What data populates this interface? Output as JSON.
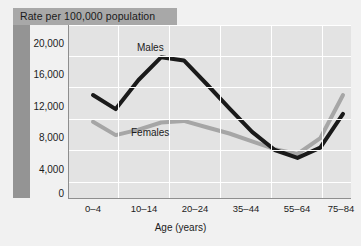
{
  "title": "Rate per 100,000 population",
  "axis": {
    "x_title": "Age (years)",
    "y_ticks": [
      "20,000",
      "16,000",
      "12,000",
      "8,000",
      "4,000",
      "0"
    ],
    "x_ticks": [
      "0–4",
      "10–14",
      "20–24",
      "35–44",
      "55–64",
      "75–84"
    ]
  },
  "series_labels": {
    "males": "Males",
    "females": "Females"
  },
  "colors": {
    "males_line": "#1a1a1a",
    "females_line": "#a6a6a6",
    "plot_bg": "#e3e3e3",
    "panel_bg": "#f1f1f1",
    "title_band": "#a8a8a8",
    "left_bar": "#949494",
    "gridline": "#ffffff",
    "axis": "#8e8e8e"
  },
  "chart_data": {
    "type": "line",
    "title": "Rate per 100,000 population",
    "xlabel": "Age (years)",
    "ylabel": "Rate per 100,000 population",
    "ylim": [
      0,
      22000
    ],
    "yticks": [
      0,
      4000,
      8000,
      12000,
      16000,
      20000
    ],
    "ytick_labels": [
      "0",
      "4,000",
      "8,000",
      "12,000",
      "16,000",
      "20,000"
    ],
    "grid": true,
    "legend": "inline-annotations",
    "x": [
      "0–4",
      "5–9",
      "10–14",
      "15–19",
      "20–24",
      "25–34",
      "35–44",
      "45–54",
      "55–64",
      "65–74",
      "75–84",
      "85+"
    ],
    "xtick_labels_shown": [
      "0–4",
      "10–14",
      "20–24",
      "35–44",
      "55–64",
      "75–84"
    ],
    "series": [
      {
        "name": "Males",
        "color": "#1a1a1a",
        "values": [
          13100,
          11300,
          15000,
          17900,
          17500,
          14500,
          11400,
          8400,
          6100,
          5100,
          6400,
          10700
        ]
      },
      {
        "name": "Females",
        "color": "#a6a6a6",
        "values": [
          9700,
          8000,
          8700,
          9600,
          9800,
          9000,
          8200,
          7200,
          6200,
          5600,
          7600,
          13100
        ]
      }
    ]
  }
}
